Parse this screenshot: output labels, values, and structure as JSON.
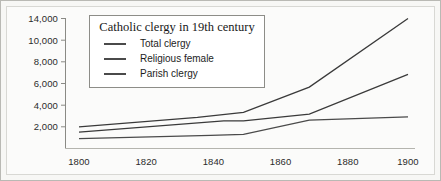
{
  "chart_data": {
    "type": "line",
    "title": "Catholic clergy in 19th century",
    "xlabel": "",
    "ylabel": "",
    "xlim": [
      1795,
      1902
    ],
    "ylim": [
      0,
      14800
    ],
    "grid": false,
    "legend_position": "top-left-inset",
    "xticks": [
      "1800",
      "1820",
      "1840",
      "1860",
      "1880",
      "1900"
    ],
    "xtick_values": [
      1800,
      1820,
      1840,
      1860,
      1880,
      1900
    ],
    "yticks": [
      "2,000",
      "4,000",
      "6,000",
      "8,000",
      "10,000",
      "14,000"
    ],
    "ytick_values": [
      2000,
      4000,
      6000,
      8000,
      10000,
      14000
    ],
    "series": [
      {
        "name": "Total clergy",
        "color": "#3a3a3a",
        "x": [
          1800,
          1836,
          1850,
          1870,
          1900
        ],
        "values": [
          2000,
          3050,
          3600,
          6400,
          14000
        ]
      },
      {
        "name": "Religious female",
        "color": "#3a3a3a",
        "x": [
          1800,
          1844,
          1850,
          1870,
          1900
        ],
        "values": [
          1400,
          2650,
          2650,
          3400,
          7800
        ]
      },
      {
        "name": "Parish clergy",
        "color": "#4a4a4a",
        "x": [
          1800,
          1840,
          1850,
          1870,
          1900
        ],
        "values": [
          700,
          1050,
          1150,
          2750,
          3100
        ]
      }
    ]
  },
  "legend": {
    "title": "Catholic clergy in 19th century",
    "entries": [
      {
        "label": "Total clergy"
      },
      {
        "label": "Religious female"
      },
      {
        "label": "Parish clergy"
      }
    ]
  }
}
